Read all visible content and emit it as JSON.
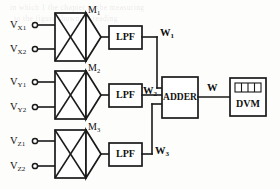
{
  "diagram": {
    "background_color": "#fdfdfc",
    "line_color": "#1a1a1a",
    "inputs": [
      {
        "id": "vx1",
        "base": "V",
        "sub": "X1",
        "label": "V_X1",
        "terminal": "circle"
      },
      {
        "id": "vx2",
        "base": "V",
        "sub": "X2",
        "label": "V_X2",
        "terminal": "circle"
      },
      {
        "id": "vy1",
        "base": "V",
        "sub": "Y1",
        "label": "V_Y1",
        "terminal": "circle"
      },
      {
        "id": "vy2",
        "base": "V",
        "sub": "Y2",
        "label": "V_Y2",
        "terminal": "circle"
      },
      {
        "id": "vz1",
        "base": "V",
        "sub": "Z1",
        "label": "V_Z1",
        "terminal": "circle"
      },
      {
        "id": "vz2",
        "base": "V",
        "sub": "Z2",
        "label": "V_Z2",
        "terminal": "circle"
      }
    ],
    "multipliers": [
      {
        "id": "m1",
        "base": "M",
        "sub": "1",
        "label": "M1",
        "symbol": "multiplier-x"
      },
      {
        "id": "m2",
        "base": "M",
        "sub": "2",
        "label": "M2",
        "symbol": "multiplier-x"
      },
      {
        "id": "m3",
        "base": "M",
        "sub": "3",
        "label": "M3",
        "symbol": "multiplier-x"
      }
    ],
    "filters": [
      {
        "id": "lpf1",
        "label": "LPF"
      },
      {
        "id": "lpf2",
        "label": "LPF"
      },
      {
        "id": "lpf3",
        "label": "LPF"
      }
    ],
    "signals": [
      {
        "id": "w1",
        "base": "W",
        "sub": "1",
        "label": "W1"
      },
      {
        "id": "w2",
        "base": "W",
        "sub": "2",
        "label": "W2"
      },
      {
        "id": "w3",
        "base": "W",
        "sub": "3",
        "label": "W3"
      },
      {
        "id": "w",
        "base": "W",
        "sub": "",
        "label": "W"
      }
    ],
    "adder": {
      "id": "adder",
      "label": "ADDER"
    },
    "meter": {
      "id": "dvm",
      "label": "DVM",
      "display_segments": 4
    },
    "ghost_text": [
      "in which  1  the  chapter  of  the  measuring",
      "to   the    figure   shown   by   reading"
    ]
  }
}
